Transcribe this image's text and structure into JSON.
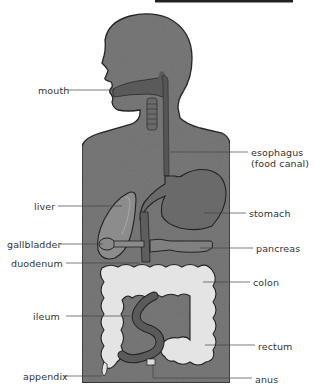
{
  "figure": {
    "title_bar_present": true,
    "colors": {
      "body_fill": "#7a7a7a",
      "body_outline": "#2a2a2a",
      "organ_dark": "#5e5e5e",
      "organ_mid": "#8a8a8a",
      "colon_fill": "#e6e6e6",
      "leader_line": "#333333",
      "label_text": "#333333"
    }
  },
  "labels": {
    "left": [
      {
        "id": "mouth",
        "text": "mouth"
      },
      {
        "id": "liver",
        "text": "liver"
      },
      {
        "id": "gallbladder",
        "text": "gallbladder"
      },
      {
        "id": "duodenum",
        "text": "duodenum"
      },
      {
        "id": "ileum",
        "text": "ileum"
      },
      {
        "id": "appendix",
        "text": "appendix"
      }
    ],
    "right": [
      {
        "id": "esophagus",
        "text": "esophagus",
        "subtext": "(food canal)"
      },
      {
        "id": "stomach",
        "text": "stomach"
      },
      {
        "id": "pancreas",
        "text": "pancreas"
      },
      {
        "id": "colon",
        "text": "colon"
      },
      {
        "id": "rectum",
        "text": "rectum"
      },
      {
        "id": "anus",
        "text": "anus"
      }
    ]
  }
}
